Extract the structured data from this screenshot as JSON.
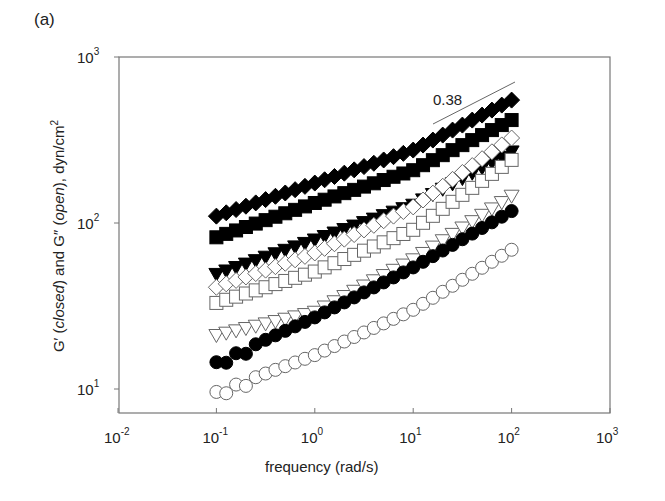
{
  "panel_label": "(a)",
  "ylabel": "G′ (closed) and G″ (open), dyn/cm²",
  "ylabel_parts": {
    "a": "G′ (",
    "b": "closed",
    "c": ") and G″ (",
    "d": "open",
    "e": "), dyn/cm",
    "f": "2"
  },
  "xlabel": "frequency (rad/s)",
  "annotation": "0.38",
  "chart_data": {
    "type": "scatter",
    "title": "",
    "xlabel": "frequency (rad/s)",
    "ylabel": "G' (closed) and G'' (open), dyn/cm2",
    "xscale": "log",
    "yscale": "log",
    "xlim": [
      0.01,
      1000
    ],
    "ylim": [
      7,
      1000
    ],
    "xticks": [
      "10^-2",
      "10^-1",
      "10^0",
      "10^1",
      "10^2",
      "10^3"
    ],
    "yticks": [
      "10^1",
      "10^2",
      "10^3"
    ],
    "grid": false,
    "legend": "none",
    "annotations": [
      {
        "text": "0.38",
        "type": "slope-line",
        "x": [
          18,
          105
        ],
        "y": [
          400,
          730
        ]
      }
    ],
    "x": [
      0.1,
      1,
      10,
      100
    ],
    "series": [
      {
        "name": "filled diamond (G')",
        "marker": "diamond",
        "filled": true,
        "values": [
          110,
          174,
          275,
          550
        ]
      },
      {
        "name": "filled square (G')",
        "marker": "square",
        "filled": true,
        "values": [
          82,
          132,
          208,
          417
        ]
      },
      {
        "name": "filled triangle-down (G')",
        "marker": "triangle-down",
        "filled": true,
        "values": [
          49,
          79,
          128,
          268
        ]
      },
      {
        "name": "open diamond (G'')",
        "marker": "diamond",
        "filled": false,
        "values": [
          41,
          66,
          125,
          325
        ]
      },
      {
        "name": "open square (G'')",
        "marker": "square",
        "filled": false,
        "values": [
          33,
          51,
          91,
          240
        ]
      },
      {
        "name": "open triangle-down (G'')",
        "marker": "triangle-down",
        "filled": false,
        "values": [
          21,
          29,
          60,
          145
        ]
      },
      {
        "name": "filled circle (G')",
        "marker": "circle",
        "filled": true,
        "values": [
          14.5,
          27,
          54,
          118
        ]
      },
      {
        "name": "open circle (G'')",
        "marker": "circle",
        "filled": false,
        "values": [
          9.6,
          16,
          30,
          69
        ]
      }
    ]
  }
}
